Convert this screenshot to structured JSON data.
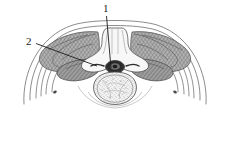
{
  "figure": {
    "type": "anatomical-line-drawing",
    "background_color": "#ffffff",
    "ink_color": "#3a3a3a",
    "label_color": "#1a1a1a"
  },
  "labels": [
    {
      "id": "1",
      "text": "1",
      "x": 104,
      "y": 10,
      "leader_from": [
        106,
        16
      ],
      "leader_to": [
        110,
        70
      ],
      "target": "spinous-process-and-spinal-canal"
    },
    {
      "id": "2",
      "text": "2",
      "x": 29,
      "y": 43,
      "leader_from": [
        36,
        44
      ],
      "leader_to": [
        96,
        66
      ],
      "target": "transverse-process-rib-articulation"
    }
  ],
  "structures": {
    "body_contour": "outer skin and fascia arcs sweeping laterally and inferiorly",
    "muscle_mass_left": "cross-hatched paraspinal muscle, left",
    "muscle_mass_right": "cross-hatched paraspinal muscle, right",
    "vertebral_body": "stippled cancellous bone, rounded, inferior center",
    "spinal_canal": "dark central canal containing spinal cord",
    "spinous_process": "midline posterior bony projection",
    "transverse_process_left": "lateral bony process, left",
    "transverse_process_right": "lateral bony process, right",
    "rib_arcs_left": "four curved rib lines, left",
    "rib_arcs_right": "four curved rib lines, right"
  },
  "colors": {
    "muscle_fill": "#a8a8a8",
    "muscle_hatch": "#6f6f6f",
    "bone_fill": "#f2f2f2",
    "bone_stipple": "#7a7a7a",
    "canal_dark": "#2b2b2b",
    "outline": "#4a4a4a"
  }
}
